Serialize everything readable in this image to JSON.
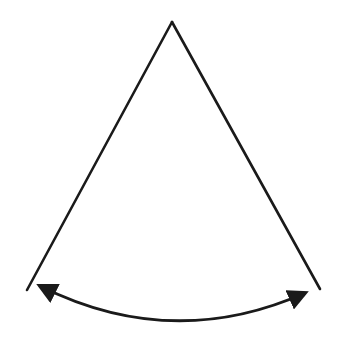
{
  "diagram": {
    "colors": {
      "stroke": "#1a1a1a",
      "background": "#ffffff"
    },
    "apex": [
      172,
      22
    ],
    "left_end": [
      27,
      290
    ],
    "right_end": [
      320,
      289
    ],
    "arc": {
      "start": [
        38,
        284
      ],
      "end": [
        306,
        292
      ],
      "control": [
        172,
        352
      ]
    },
    "labels": []
  }
}
